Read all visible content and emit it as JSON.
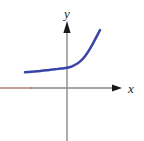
{
  "figure": {
    "name": "exponential-growth-graph",
    "width": 144,
    "height": 141,
    "background_color": "#ffffff"
  },
  "axes": {
    "x_axis": {
      "label": "x",
      "icon": "arrow-right-icon",
      "color": "#8a8a8a",
      "highlight_color": "#a8776f",
      "y_position": 88,
      "start_x": 0,
      "arrow_tip_x": 122
    },
    "y_axis": {
      "label": "y",
      "icon": "arrow-up-icon",
      "color": "#8a8a8a",
      "x_position": 67,
      "arrow_tip_y": 21,
      "end_y": 141
    }
  },
  "chart_data": {
    "type": "line",
    "title": "",
    "xlabel": "x",
    "ylabel": "y",
    "grid": false,
    "legend": null,
    "series": [
      {
        "name": "exponential-curve",
        "color": "#3a44a8",
        "line_width": 2.5,
        "points": [
          [
            25,
            72.2
          ],
          [
            31,
            71.8
          ],
          [
            37,
            71.3
          ],
          [
            43,
            70.6
          ],
          [
            49,
            70.0
          ],
          [
            55,
            69.3
          ],
          [
            61,
            68.6
          ],
          [
            67,
            67.8
          ],
          [
            72,
            66.3
          ],
          [
            77,
            63.8
          ],
          [
            81,
            60.6
          ],
          [
            85,
            56.2
          ],
          [
            89,
            50.4
          ],
          [
            93,
            43.4
          ],
          [
            97,
            35.8
          ],
          [
            100,
            30.0
          ]
        ]
      }
    ],
    "xlim": [
      0,
      144
    ],
    "ylim": [
      141,
      0
    ]
  }
}
